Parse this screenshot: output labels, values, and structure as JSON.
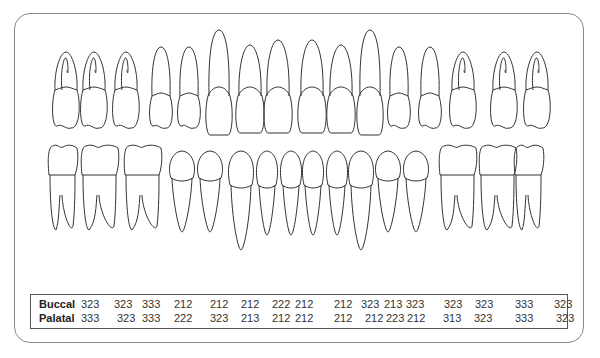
{
  "table": {
    "rows": [
      {
        "label": "Buccal",
        "values": [
          "323",
          "323",
          "333",
          "212",
          "212",
          "212",
          "222",
          "212",
          "212",
          "323",
          "213",
          "323",
          "323",
          "323",
          "333",
          "323"
        ],
        "x": [
          80,
          113,
          141,
          173,
          209,
          240,
          271,
          294,
          333,
          360,
          383,
          405,
          443,
          474,
          514,
          553
        ]
      },
      {
        "label": "Palatal",
        "values": [
          "333",
          "323",
          "333",
          "222",
          "323",
          "213",
          "212",
          "212",
          "212",
          "212",
          "223",
          "212",
          "313",
          "323",
          "333",
          "323"
        ],
        "x": [
          80,
          116,
          141,
          173,
          209,
          240,
          271,
          294,
          333,
          364,
          385,
          406,
          442,
          473,
          514,
          555
        ]
      }
    ]
  },
  "upper_teeth": [
    {
      "cx": 66,
      "type": "molar"
    },
    {
      "cx": 94,
      "type": "molar"
    },
    {
      "cx": 126,
      "type": "molar"
    },
    {
      "cx": 161,
      "type": "premolar"
    },
    {
      "cx": 189,
      "type": "premolar"
    },
    {
      "cx": 219,
      "type": "canine"
    },
    {
      "cx": 250,
      "type": "incisor"
    },
    {
      "cx": 278,
      "type": "incisor"
    },
    {
      "cx": 312,
      "type": "incisor"
    },
    {
      "cx": 341,
      "type": "incisor"
    },
    {
      "cx": 370,
      "type": "canine"
    },
    {
      "cx": 399,
      "type": "premolar"
    },
    {
      "cx": 430,
      "type": "premolar"
    },
    {
      "cx": 463,
      "type": "molar"
    },
    {
      "cx": 504,
      "type": "molar"
    },
    {
      "cx": 537,
      "type": "molar"
    }
  ],
  "lower_teeth": [
    {
      "cx": 63,
      "type": "molar"
    },
    {
      "cx": 100,
      "type": "molar"
    },
    {
      "cx": 143,
      "type": "molar"
    },
    {
      "cx": 182,
      "type": "premolar"
    },
    {
      "cx": 210,
      "type": "premolar"
    },
    {
      "cx": 241,
      "type": "canine"
    },
    {
      "cx": 267,
      "type": "incisor"
    },
    {
      "cx": 291,
      "type": "incisor"
    },
    {
      "cx": 313,
      "type": "incisor"
    },
    {
      "cx": 337,
      "type": "incisor"
    },
    {
      "cx": 361,
      "type": "canine"
    },
    {
      "cx": 388,
      "type": "premolar"
    },
    {
      "cx": 416,
      "type": "premolar"
    },
    {
      "cx": 458,
      "type": "molar"
    },
    {
      "cx": 498,
      "type": "molar"
    },
    {
      "cx": 529,
      "type": "molar"
    }
  ],
  "colors": {
    "stroke": "#333333",
    "border": "#888888",
    "text": "#333333"
  }
}
